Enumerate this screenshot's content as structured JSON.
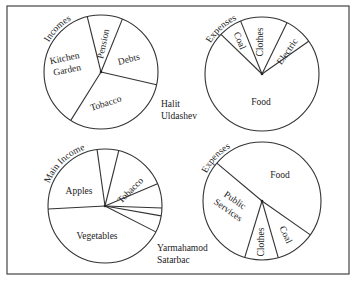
{
  "frame": {
    "x": 7,
    "y": 6,
    "w": 342,
    "h": 268,
    "stroke": "#444444"
  },
  "people": [
    {
      "name_line1": "Halit",
      "name_line2": "Uldashev"
    },
    {
      "name_line1": "Yarmahamod",
      "name_line2": "Satarbac"
    }
  ],
  "chart_data": [
    {
      "type": "pie",
      "title": "Incomes",
      "owner": "Halit Uldashev",
      "center": [
        101,
        72
      ],
      "radius": 57,
      "title_angle": 315,
      "slices": [
        {
          "label": "Pension",
          "start": 346,
          "end": 22,
          "percent": 10,
          "label_pos": [
            104,
            44
          ],
          "label_rot": -78
        },
        {
          "label": "Debts",
          "start": 22,
          "end": 103,
          "percent": 22.5,
          "label_pos": [
            129,
            60
          ],
          "label_rot": -15
        },
        {
          "label": "Tobacco",
          "start": 103,
          "end": 212,
          "percent": 30,
          "label_pos": [
            106,
            104
          ],
          "label_rot": -18
        },
        {
          "label": "Kitchen Garden",
          "start": 212,
          "end": 346,
          "percent": 37.5,
          "label_pos": [
            66,
            65
          ],
          "label_rot": -12,
          "multiline": [
            "Kitchen",
            "Garden"
          ]
        }
      ]
    },
    {
      "type": "pie",
      "title": "Expenses",
      "owner": "Halit Uldashev",
      "center": [
        262,
        74
      ],
      "radius": 57,
      "title_angle": 318,
      "slices": [
        {
          "label": "Coal",
          "start": 314,
          "end": 338,
          "percent": 6.7,
          "label_pos": [
            239,
            41
          ],
          "label_rot": 67
        },
        {
          "label": "Clothes",
          "start": 338,
          "end": 26,
          "percent": 13.3,
          "label_pos": [
            261,
            42
          ],
          "label_rot": -90
        },
        {
          "label": "Electric",
          "start": 26,
          "end": 55,
          "percent": 8,
          "label_pos": [
            288,
            52
          ],
          "label_rot": -55
        },
        {
          "label": "Food",
          "start": 55,
          "end": 314,
          "percent": 72,
          "label_pos": [
            261,
            103
          ],
          "label_rot": 0
        }
      ]
    },
    {
      "type": "pie",
      "title": "Main Incomes",
      "owner": "Yarmahamod Satarbac",
      "center": [
        105,
        206
      ],
      "radius": 57,
      "title_angle": 318,
      "slices": [
        {
          "label": "Apples",
          "start": 267,
          "end": 352,
          "percent": 23.6,
          "label_pos": [
            79,
            192
          ],
          "label_rot": 0
        },
        {
          "label": "",
          "start": 352,
          "end": 14,
          "percent": 6.1
        },
        {
          "label": "Tobacco",
          "start": 14,
          "end": 67,
          "percent": 14.7,
          "label_pos": [
            131,
            191
          ],
          "label_rot": -45
        },
        {
          "label": "",
          "start": 67,
          "end": 92,
          "percent": 6.9
        },
        {
          "label": "",
          "start": 92,
          "end": 100,
          "percent": 2.2
        },
        {
          "label": "",
          "start": 100,
          "end": 117,
          "percent": 4.7
        },
        {
          "label": "Vegetables",
          "start": 117,
          "end": 267,
          "percent": 41.7,
          "label_pos": [
            97,
            237
          ],
          "label_rot": 0
        }
      ]
    },
    {
      "type": "pie",
      "title": "Expenses",
      "owner": "Yarmahamod Satarbac",
      "center": [
        262,
        201
      ],
      "radius": 59,
      "title_angle": 313,
      "slices": [
        {
          "label": "Food",
          "start": 310,
          "end": 125,
          "percent": 48.6,
          "label_pos": [
            280,
            176
          ],
          "label_rot": 0
        },
        {
          "label": "Coal",
          "start": 125,
          "end": 164,
          "percent": 10.8,
          "label_pos": [
            285,
            235
          ],
          "label_rot": 65
        },
        {
          "label": "Clothes",
          "start": 164,
          "end": 197,
          "percent": 9.2,
          "label_pos": [
            262,
            242
          ],
          "label_rot": -90
        },
        {
          "label": "Public Services",
          "start": 197,
          "end": 310,
          "percent": 31.4,
          "label_pos": [
            231,
            206
          ],
          "label_rot": 35,
          "multiline": [
            "Public",
            "Services"
          ]
        }
      ]
    }
  ]
}
